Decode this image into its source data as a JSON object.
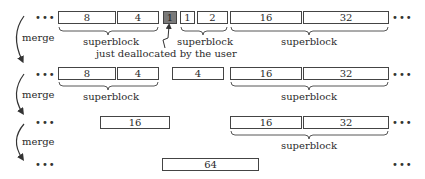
{
  "rows": [
    {
      "blocks": [
        {
          "label": "8",
          "x": 58,
          "w": 58,
          "gray": false
        },
        {
          "label": "4",
          "x": 117,
          "w": 42,
          "gray": false
        },
        {
          "label": "1",
          "x": 163,
          "w": 14,
          "gray": true
        },
        {
          "label": "1",
          "x": 180,
          "w": 15,
          "gray": false
        },
        {
          "label": "2",
          "x": 197,
          "w": 31,
          "gray": false
        },
        {
          "label": "16",
          "x": 230,
          "w": 72,
          "gray": false
        },
        {
          "label": "32",
          "x": 303,
          "w": 86,
          "gray": false
        }
      ],
      "superblocks": [
        {
          "label": "superblock",
          "x1": 58,
          "x2": 158
        },
        {
          "label": "superblock",
          "x1": 180,
          "x2": 227
        },
        {
          "label": "superblock",
          "x1": 230,
          "x2": 388
        }
      ],
      "annotation": "just deallocated by the user"
    },
    {
      "blocks": [
        {
          "label": "8",
          "x": 58,
          "w": 58,
          "gray": false
        },
        {
          "label": "4",
          "x": 117,
          "w": 42,
          "gray": false
        },
        {
          "label": "4",
          "x": 172,
          "w": 52,
          "gray": false
        },
        {
          "label": "16",
          "x": 230,
          "w": 72,
          "gray": false
        },
        {
          "label": "32",
          "x": 303,
          "w": 86,
          "gray": false
        }
      ],
      "superblocks": [
        {
          "label": "superblock",
          "x1": 58,
          "x2": 158
        },
        {
          "label": "superblock",
          "x1": 230,
          "x2": 388
        }
      ]
    },
    {
      "blocks": [
        {
          "label": "16",
          "x": 100,
          "w": 70,
          "gray": false
        },
        {
          "label": "16",
          "x": 230,
          "w": 72,
          "gray": false
        },
        {
          "label": "32",
          "x": 303,
          "w": 86,
          "gray": false
        }
      ],
      "superblocks": [
        {
          "label": "superblock",
          "x1": 230,
          "x2": 388
        }
      ]
    },
    {
      "blocks": [
        {
          "label": "64",
          "x": 162,
          "w": 97,
          "gray": false
        }
      ],
      "superblocks": []
    }
  ],
  "merge_label": "merge",
  "ellipsis": "•••"
}
